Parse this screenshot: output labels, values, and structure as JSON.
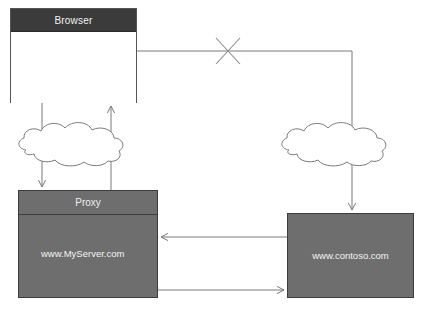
{
  "diagram": {
    "title": "Proxy browsing topology",
    "background": "#ffffff",
    "stroke": "#7a7a7a",
    "node_fill": "#6e6e6e",
    "header_fill": "#3b3b3b",
    "label_color": "#f4f4f4"
  },
  "nodes": {
    "browser": {
      "title": "Browser",
      "kind": "window"
    },
    "proxy": {
      "title": "Proxy",
      "site_label": "www.MyServer.com",
      "kind": "server"
    },
    "contoso": {
      "site_label": "www.contoso.com",
      "kind": "server"
    }
  },
  "clouds": [
    {
      "name": "left-cloud",
      "label": ""
    },
    {
      "name": "right-cloud",
      "label": ""
    }
  ],
  "markers": {
    "blocked": {
      "name": "blocked-path-x",
      "symbol": "X",
      "meaning": "blocked"
    }
  },
  "connectors": [
    {
      "name": "browser-to-right-cloud",
      "from": "browser",
      "to": "right-cloud",
      "arrow": "none",
      "blocked": true
    },
    {
      "name": "browser-down-to-left-cloud",
      "from": "browser",
      "to": "left-cloud",
      "arrow": "none"
    },
    {
      "name": "left-cloud-up-to-browser",
      "from": "left-cloud",
      "to": "browser",
      "arrow": "end"
    },
    {
      "name": "left-cloud-down-to-proxy",
      "from": "left-cloud",
      "to": "proxy",
      "arrow": "end"
    },
    {
      "name": "proxy-up-to-left-cloud",
      "from": "proxy",
      "to": "left-cloud",
      "arrow": "none"
    },
    {
      "name": "right-cloud-down-to-contoso",
      "from": "right-cloud",
      "to": "contoso",
      "arrow": "end"
    },
    {
      "name": "contoso-to-proxy",
      "from": "contoso",
      "to": "proxy",
      "arrow": "end"
    },
    {
      "name": "proxy-to-contoso",
      "from": "proxy",
      "to": "contoso",
      "arrow": "end"
    }
  ]
}
